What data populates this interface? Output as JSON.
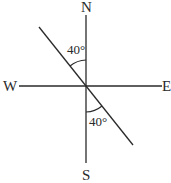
{
  "diagram": {
    "type": "compass-bearing",
    "directions": {
      "north": "N",
      "south": "S",
      "east": "E",
      "west": "W"
    },
    "angles": [
      {
        "label": "40°",
        "position": "upper",
        "between": "N and line (NW side)",
        "value": 40
      },
      {
        "label": "40°",
        "position": "lower",
        "between": "S and line (SE side)",
        "value": 40
      }
    ],
    "line": {
      "description": "straight line through origin, NW to SE",
      "angle_from_north_deg": 40
    },
    "colors": {
      "stroke": "#2a2a2a",
      "background": "#ffffff"
    }
  }
}
